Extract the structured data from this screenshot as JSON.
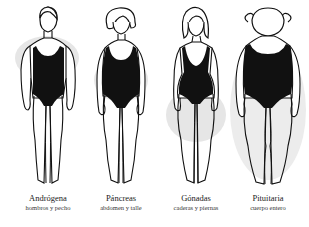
{
  "diagram": {
    "type": "body-type illustration",
    "figures": [
      {
        "id": "androgena",
        "title": "Andrógena",
        "subtitle": "hombros y pecho",
        "highlight_region": "shoulders-chest"
      },
      {
        "id": "pancreas",
        "title": "Páncreas",
        "subtitle": "abdomen y talle",
        "highlight_region": "abdomen-waist"
      },
      {
        "id": "gonadas",
        "title": "Gónadas",
        "subtitle": "caderas y piernas",
        "highlight_region": "hips-legs"
      },
      {
        "id": "pituitaria",
        "title": "Pituitaria",
        "subtitle": "cuerpo entero",
        "highlight_region": "whole-body"
      }
    ],
    "colors": {
      "outline": "#111111",
      "swimsuit": "#111111",
      "highlight": "#e4e4e4",
      "background": "#ffffff"
    }
  }
}
